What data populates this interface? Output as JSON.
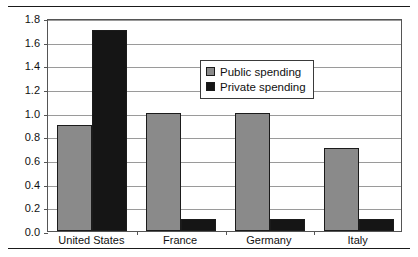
{
  "chart_data": {
    "type": "bar",
    "title": "",
    "subtitle": "",
    "xlabel": "",
    "ylabel": "",
    "categories": [
      "United States",
      "France",
      "Germany",
      "Italy"
    ],
    "series": [
      {
        "name": "Public spending",
        "values": [
          0.9,
          1.0,
          1.0,
          0.7
        ],
        "color": "#8a8a8a"
      },
      {
        "name": "Private spending",
        "values": [
          1.7,
          0.1,
          0.1,
          0.1
        ],
        "color": "#151515"
      }
    ],
    "ylim": [
      0.0,
      1.8
    ],
    "ytick_step": 0.2,
    "yticks": [
      "0.0",
      "0.2",
      "0.4",
      "0.6",
      "0.8",
      "1.0",
      "1.2",
      "1.4",
      "1.6",
      "1.8"
    ],
    "grid": true,
    "legend_position": "upper-center-inside"
  },
  "legend": {
    "items": [
      {
        "label": "Public spending",
        "swatch": "public-swatch"
      },
      {
        "label": "Private spending",
        "swatch": "private-swatch"
      }
    ]
  }
}
